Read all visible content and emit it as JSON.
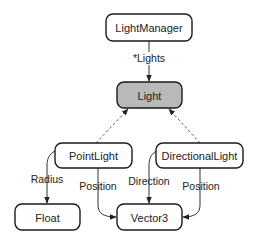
{
  "diagram": {
    "type": "class-relationship",
    "nodes": [
      {
        "id": "LightManager",
        "label": "LightManager",
        "highlighted": false
      },
      {
        "id": "Light",
        "label": "Light",
        "highlighted": true
      },
      {
        "id": "PointLight",
        "label": "PointLight",
        "highlighted": false
      },
      {
        "id": "DirectionalLight",
        "label": "DirectionalLight",
        "highlighted": false
      },
      {
        "id": "Float",
        "label": "Float",
        "highlighted": false
      },
      {
        "id": "Vector3",
        "label": "Vector3",
        "highlighted": false
      }
    ],
    "edges": [
      {
        "from": "LightManager",
        "to": "Light",
        "label": "*Lights",
        "style": "solid"
      },
      {
        "from": "PointLight",
        "to": "Light",
        "label": "",
        "style": "dashed"
      },
      {
        "from": "DirectionalLight",
        "to": "Light",
        "label": "",
        "style": "dashed"
      },
      {
        "from": "PointLight",
        "to": "Float",
        "label": "Radius",
        "style": "solid"
      },
      {
        "from": "PointLight",
        "to": "Vector3",
        "label": "Position",
        "style": "solid"
      },
      {
        "from": "DirectionalLight",
        "to": "Vector3",
        "label": "Direction",
        "style": "solid"
      },
      {
        "from": "DirectionalLight",
        "to": "Vector3",
        "label": "Position",
        "style": "solid"
      }
    ],
    "colors": {
      "highlight_fill": "#b9b9b9",
      "node_fill": "#ffffff",
      "stroke": "#1a1a1a"
    }
  }
}
